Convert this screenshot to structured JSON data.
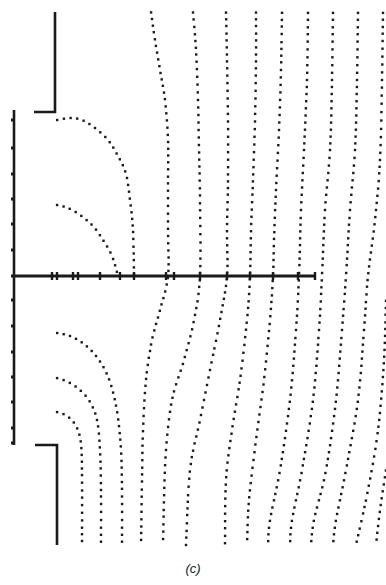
{
  "figure": {
    "caption": "(c)",
    "ink_color": "#1a1a1a",
    "background": "#ffffff",
    "dot_size": 2.4,
    "dot_spacing": 6.5
  },
  "walls": {
    "upper_electrode": [
      [
        55,
        12
      ],
      [
        55,
        112
      ],
      [
        34,
        112
      ]
    ],
    "lower_electrode": [
      [
        35,
        445
      ],
      [
        57,
        445
      ],
      [
        57,
        545
      ]
    ],
    "left_plane": [
      [
        14,
        110
      ],
      [
        14,
        445
      ]
    ],
    "axis": [
      [
        14,
        276
      ],
      [
        315,
        276
      ]
    ]
  },
  "left_plane_ticks": [
    120,
    148,
    174,
    199,
    224,
    250,
    276,
    300,
    326,
    352,
    377,
    402,
    428,
    443
  ],
  "axis_ticks": [
    52,
    57,
    73,
    78,
    100,
    120,
    134,
    166,
    174,
    200,
    227,
    250,
    273,
    298,
    315
  ],
  "field_lines": [
    [
      [
        57,
        120
      ],
      [
        70,
        118
      ],
      [
        82,
        120
      ],
      [
        95,
        128
      ],
      [
        108,
        140
      ],
      [
        118,
        156
      ],
      [
        126,
        174
      ],
      [
        130,
        200
      ],
      [
        133,
        230
      ],
      [
        134,
        276
      ]
    ],
    [
      [
        57,
        205
      ],
      [
        68,
        208
      ],
      [
        80,
        215
      ],
      [
        93,
        226
      ],
      [
        103,
        240
      ],
      [
        112,
        256
      ],
      [
        118,
        276
      ]
    ],
    [
      [
        57,
        333
      ],
      [
        70,
        336
      ],
      [
        84,
        344
      ],
      [
        96,
        356
      ],
      [
        106,
        372
      ],
      [
        113,
        392
      ],
      [
        118,
        418
      ],
      [
        121,
        450
      ],
      [
        122,
        490
      ],
      [
        122,
        545
      ]
    ],
    [
      [
        57,
        378
      ],
      [
        68,
        382
      ],
      [
        80,
        390
      ],
      [
        90,
        402
      ],
      [
        97,
        420
      ],
      [
        100,
        450
      ],
      [
        101,
        490
      ],
      [
        101,
        545
      ]
    ],
    [
      [
        57,
        412
      ],
      [
        67,
        416
      ],
      [
        76,
        426
      ],
      [
        81,
        444
      ],
      [
        82,
        480
      ],
      [
        82,
        545
      ]
    ],
    [
      [
        151,
        12
      ],
      [
        155,
        40
      ],
      [
        160,
        70
      ],
      [
        165,
        100
      ],
      [
        168,
        140
      ],
      [
        168,
        180
      ],
      [
        168,
        230
      ],
      [
        168,
        276
      ],
      [
        160,
        310
      ],
      [
        152,
        340
      ],
      [
        146,
        380
      ],
      [
        143,
        430
      ],
      [
        142,
        480
      ],
      [
        141,
        545
      ]
    ],
    [
      [
        193,
        12
      ],
      [
        196,
        50
      ],
      [
        198,
        100
      ],
      [
        199,
        150
      ],
      [
        200,
        200
      ],
      [
        200,
        276
      ],
      [
        194,
        320
      ],
      [
        184,
        360
      ],
      [
        172,
        400
      ],
      [
        166,
        450
      ],
      [
        164,
        500
      ],
      [
        163,
        545
      ]
    ],
    [
      [
        226,
        12
      ],
      [
        227,
        60
      ],
      [
        228,
        120
      ],
      [
        228,
        180
      ],
      [
        227,
        230
      ],
      [
        227,
        276
      ],
      [
        220,
        320
      ],
      [
        210,
        370
      ],
      [
        200,
        420
      ],
      [
        190,
        470
      ],
      [
        186,
        545
      ]
    ],
    [
      [
        256,
        12
      ],
      [
        256,
        60
      ],
      [
        255,
        120
      ],
      [
        253,
        180
      ],
      [
        251,
        230
      ],
      [
        250,
        276
      ],
      [
        247,
        320
      ],
      [
        240,
        380
      ],
      [
        232,
        430
      ],
      [
        226,
        480
      ],
      [
        225,
        545
      ]
    ],
    [
      [
        282,
        12
      ],
      [
        281,
        70
      ],
      [
        279,
        130
      ],
      [
        276,
        190
      ],
      [
        274,
        240
      ],
      [
        273,
        276
      ],
      [
        270,
        320
      ],
      [
        264,
        380
      ],
      [
        256,
        440
      ],
      [
        249,
        500
      ],
      [
        247,
        545
      ]
    ],
    [
      [
        308,
        12
      ],
      [
        307,
        80
      ],
      [
        304,
        150
      ],
      [
        301,
        210
      ],
      [
        299,
        276
      ],
      [
        296,
        330
      ],
      [
        290,
        400
      ],
      [
        280,
        470
      ],
      [
        270,
        520
      ],
      [
        268,
        545
      ]
    ],
    [
      [
        333,
        12
      ],
      [
        332,
        80
      ],
      [
        330,
        150
      ],
      [
        325,
        210
      ],
      [
        322,
        276
      ],
      [
        319,
        330
      ],
      [
        313,
        400
      ],
      [
        302,
        470
      ],
      [
        292,
        520
      ],
      [
        290,
        545
      ]
    ],
    [
      [
        358,
        12
      ],
      [
        357,
        80
      ],
      [
        355,
        150
      ],
      [
        350,
        210
      ],
      [
        346,
        276
      ],
      [
        342,
        330
      ],
      [
        336,
        400
      ],
      [
        326,
        470
      ],
      [
        314,
        520
      ],
      [
        311,
        545
      ]
    ],
    [
      [
        383,
        12
      ],
      [
        382,
        80
      ],
      [
        380,
        160
      ],
      [
        375,
        220
      ],
      [
        368,
        276
      ],
      [
        364,
        330
      ],
      [
        358,
        400
      ],
      [
        346,
        470
      ],
      [
        336,
        520
      ],
      [
        333,
        545
      ]
    ],
    [
      [
        386,
        300
      ],
      [
        384,
        360
      ],
      [
        378,
        430
      ],
      [
        368,
        490
      ],
      [
        356,
        545
      ]
    ],
    [
      [
        386,
        470
      ],
      [
        380,
        510
      ],
      [
        376,
        545
      ]
    ]
  ]
}
